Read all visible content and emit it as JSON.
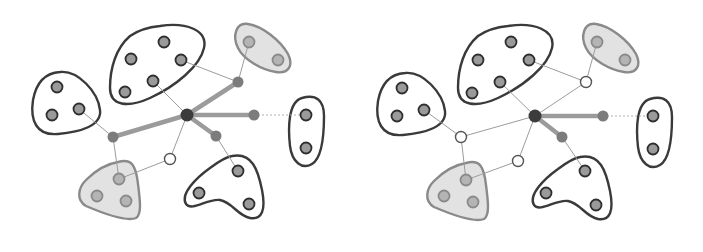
{
  "colors": {
    "background": "#ffffff",
    "cluster_stroke": "#3a3a3a",
    "shaded_cluster_stroke": "#8a8a8a",
    "shaded_cluster_fill": "#e2e2e2",
    "member_node_fill": "#9a9a9a",
    "member_node_stroke": "#2e2e2e",
    "shaded_member_fill": "#b4b4b4",
    "shaded_member_stroke": "#8a8a8a",
    "hub_fill": "#3c3c3c",
    "intermediate_fill": "#7c7c7c",
    "white_node_fill": "#ffffff",
    "white_node_stroke": "#555555",
    "thin_edge": "#9c9c9c",
    "thick_edge": "#8a8a8a",
    "dotted_edge": "#b0b0b0"
  },
  "panels": [
    {
      "id": "left",
      "hub": {
        "x": 187,
        "y": 115
      },
      "clusters": [
        {
          "name": "left-cluster",
          "shaded": false,
          "path": "M60,72 C78,70 98,92 100,110 C102,126 80,132 58,134 C36,136 30,120 33,100 C36,84 44,73 60,72 Z",
          "nodes": [
            {
              "x": 57,
              "y": 87
            },
            {
              "x": 52,
              "y": 115
            },
            {
              "x": 79,
              "y": 109
            }
          ]
        },
        {
          "name": "top-cluster",
          "shaded": false,
          "path": "M160,26 C186,22 208,30 204,48 C200,66 176,86 150,98 C128,108 110,106 110,88 C110,68 116,48 130,36 C140,29 150,27 160,26 Z",
          "nodes": [
            {
              "x": 164,
              "y": 42
            },
            {
              "x": 131,
              "y": 59
            },
            {
              "x": 181,
              "y": 60
            },
            {
              "x": 153,
              "y": 81
            },
            {
              "x": 125,
              "y": 92
            }
          ]
        },
        {
          "name": "top-right-cluster",
          "shaded": true,
          "path": "M248,24 C262,26 280,40 288,54 C294,66 288,74 276,72 C262,70 244,60 238,48 C232,36 236,22 248,24 Z",
          "nodes": [
            {
              "x": 249,
              "y": 42
            },
            {
              "x": 278,
              "y": 60
            }
          ]
        },
        {
          "name": "right-cluster",
          "shaded": false,
          "path": "M302,98 C316,94 324,100 324,116 C324,134 322,158 312,164 C302,170 292,162 290,146 C288,128 288,102 302,98 Z",
          "nodes": [
            {
              "x": 306,
              "y": 115
            },
            {
              "x": 306,
              "y": 148
            }
          ]
        },
        {
          "name": "bottom-left-cluster",
          "shaded": true,
          "path": "M118,162 C132,158 136,166 138,184 C140,200 142,214 136,218 C126,222 100,212 86,206 C76,200 78,188 86,180 C96,170 106,164 118,162 Z",
          "nodes": [
            {
              "x": 119,
              "y": 179
            },
            {
              "x": 97,
              "y": 196
            },
            {
              "x": 126,
              "y": 201
            }
          ]
        },
        {
          "name": "bottom-right-cluster",
          "shaded": false,
          "path": "M232,156 C252,152 258,170 262,190 C266,210 262,220 250,218 C238,216 232,202 220,200 C208,198 192,212 186,204 C180,194 196,178 210,168 C218,162 226,157 232,156 Z",
          "nodes": [
            {
              "x": 238,
              "y": 171
            },
            {
              "x": 199,
              "y": 193
            },
            {
              "x": 249,
              "y": 204
            }
          ]
        }
      ],
      "intermediates": [
        {
          "x": 238,
          "y": 82,
          "style": "filled"
        },
        {
          "x": 254,
          "y": 115,
          "style": "filled"
        },
        {
          "x": 113,
          "y": 137,
          "style": "filled"
        },
        {
          "x": 216,
          "y": 136,
          "style": "filled"
        },
        {
          "x": 170,
          "y": 159,
          "style": "white"
        }
      ],
      "thick_edges": [
        {
          "x1": 187,
          "y1": 115,
          "x2": 238,
          "y2": 82
        },
        {
          "x1": 187,
          "y1": 115,
          "x2": 254,
          "y2": 115
        },
        {
          "x1": 187,
          "y1": 115,
          "x2": 113,
          "y2": 137
        },
        {
          "x1": 187,
          "y1": 115,
          "x2": 216,
          "y2": 136
        }
      ],
      "thin_edges": [
        {
          "x1": 187,
          "y1": 115,
          "x2": 153,
          "y2": 81
        },
        {
          "x1": 187,
          "y1": 115,
          "x2": 170,
          "y2": 159
        },
        {
          "x1": 181,
          "y1": 60,
          "x2": 238,
          "y2": 82
        },
        {
          "x1": 238,
          "y1": 82,
          "x2": 249,
          "y2": 42
        },
        {
          "x1": 79,
          "y1": 109,
          "x2": 113,
          "y2": 137
        },
        {
          "x1": 113,
          "y1": 137,
          "x2": 119,
          "y2": 179
        },
        {
          "x1": 170,
          "y1": 159,
          "x2": 119,
          "y2": 179
        },
        {
          "x1": 216,
          "y1": 136,
          "x2": 238,
          "y2": 171
        }
      ],
      "dotted_edges": [
        {
          "x1": 254,
          "y1": 115,
          "x2": 306,
          "y2": 115
        }
      ]
    },
    {
      "id": "right",
      "hub": {
        "x": 535,
        "y": 116
      },
      "clusters": [
        {
          "name": "left-cluster",
          "shaded": false,
          "path": "M405,73 C423,71 443,93 445,111 C447,127 425,133 403,135 C381,137 375,121 378,101 C381,85 389,74 405,73 Z",
          "nodes": [
            {
              "x": 402,
              "y": 88
            },
            {
              "x": 397,
              "y": 116
            },
            {
              "x": 424,
              "y": 110
            }
          ]
        },
        {
          "name": "top-cluster",
          "shaded": false,
          "path": "M508,26 C534,22 556,30 552,48 C548,66 524,86 498,98 C476,108 458,106 458,88 C458,68 464,48 478,36 C488,29 498,27 508,26 Z",
          "nodes": [
            {
              "x": 511,
              "y": 42
            },
            {
              "x": 478,
              "y": 60
            },
            {
              "x": 529,
              "y": 60
            },
            {
              "x": 500,
              "y": 82
            },
            {
              "x": 472,
              "y": 93
            }
          ]
        },
        {
          "name": "top-right-cluster",
          "shaded": true,
          "path": "M596,24 C610,26 628,40 636,54 C642,66 636,74 624,72 C610,70 592,60 586,48 C580,36 584,22 596,24 Z",
          "nodes": [
            {
              "x": 597,
              "y": 42
            },
            {
              "x": 625,
              "y": 60
            }
          ]
        },
        {
          "name": "right-cluster",
          "shaded": false,
          "path": "M650,99 C664,95 672,101 672,117 C672,135 670,159 660,165 C650,171 640,163 638,147 C636,129 636,103 650,99 Z",
          "nodes": [
            {
              "x": 653,
              "y": 116
            },
            {
              "x": 653,
              "y": 149
            }
          ]
        },
        {
          "name": "bottom-left-cluster",
          "shaded": true,
          "path": "M466,163 C480,159 484,167 486,185 C488,201 490,215 484,219 C474,223 448,213 434,207 C424,201 426,189 434,181 C444,171 454,165 466,163 Z",
          "nodes": [
            {
              "x": 466,
              "y": 180
            },
            {
              "x": 444,
              "y": 196
            },
            {
              "x": 473,
              "y": 202
            }
          ]
        },
        {
          "name": "bottom-right-cluster",
          "shaded": false,
          "path": "M580,157 C600,153 606,171 610,191 C614,211 610,221 598,219 C586,217 580,203 568,201 C556,199 540,213 534,205 C528,195 544,179 558,169 C566,163 574,158 580,157 Z",
          "nodes": [
            {
              "x": 585,
              "y": 171
            },
            {
              "x": 546,
              "y": 193
            },
            {
              "x": 596,
              "y": 205
            }
          ]
        }
      ],
      "intermediates": [
        {
          "x": 586,
          "y": 82,
          "style": "white"
        },
        {
          "x": 603,
          "y": 116,
          "style": "filled"
        },
        {
          "x": 461,
          "y": 137,
          "style": "white"
        },
        {
          "x": 562,
          "y": 137,
          "style": "filled"
        },
        {
          "x": 518,
          "y": 161,
          "style": "white"
        }
      ],
      "thick_edges": [
        {
          "x1": 535,
          "y1": 116,
          "x2": 603,
          "y2": 116
        },
        {
          "x1": 535,
          "y1": 116,
          "x2": 562,
          "y2": 137
        }
      ],
      "thin_edges": [
        {
          "x1": 535,
          "y1": 116,
          "x2": 500,
          "y2": 82
        },
        {
          "x1": 535,
          "y1": 116,
          "x2": 586,
          "y2": 82
        },
        {
          "x1": 535,
          "y1": 116,
          "x2": 461,
          "y2": 137
        },
        {
          "x1": 535,
          "y1": 116,
          "x2": 518,
          "y2": 161
        },
        {
          "x1": 529,
          "y1": 60,
          "x2": 586,
          "y2": 82
        },
        {
          "x1": 586,
          "y1": 82,
          "x2": 597,
          "y2": 42
        },
        {
          "x1": 424,
          "y1": 110,
          "x2": 461,
          "y2": 137
        },
        {
          "x1": 461,
          "y1": 137,
          "x2": 466,
          "y2": 180
        },
        {
          "x1": 518,
          "y1": 161,
          "x2": 466,
          "y2": 180
        },
        {
          "x1": 562,
          "y1": 137,
          "x2": 585,
          "y2": 171
        }
      ],
      "dotted_edges": [
        {
          "x1": 603,
          "y1": 116,
          "x2": 653,
          "y2": 116
        }
      ]
    }
  ]
}
